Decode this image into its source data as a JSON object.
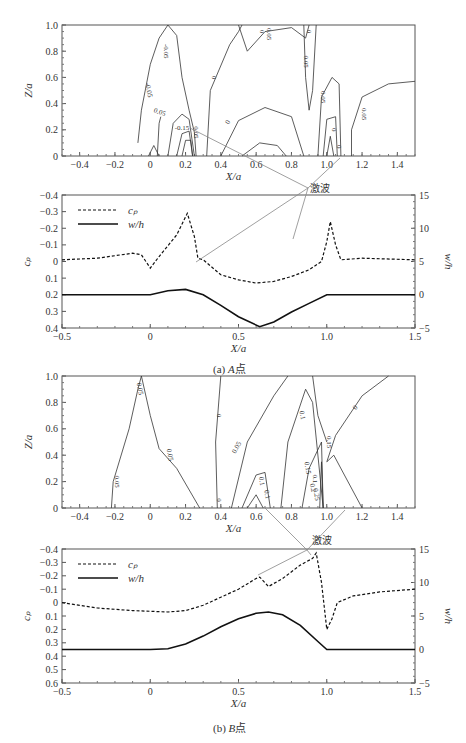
{
  "annotation": {
    "shock_label": "激波"
  },
  "captions": {
    "a": {
      "prefix": "(a)",
      "point": "A",
      "suffix": "点"
    },
    "b": {
      "prefix": "(b)",
      "point": "B",
      "suffix": "点"
    }
  },
  "chart_data": [
    {
      "id": "a-contour",
      "type": "contour",
      "title": "",
      "xlabel": "X/a",
      "ylabel": "Z/a",
      "xlim": [
        -0.5,
        1.5
      ],
      "ylim": [
        0,
        1.0
      ],
      "xticks": [
        "-0.4",
        "-0.2",
        "0",
        "0.2",
        "0.4",
        "0.6",
        "0.8",
        "1.0",
        "1.2",
        "1.4"
      ],
      "yticks": [
        "0",
        "0.2",
        "0.4",
        "0.6",
        "0.8",
        "1.0"
      ],
      "contour_labels": [
        "-0.05",
        "-0.05",
        "0.05",
        "-0.15",
        "0.05",
        "0",
        "0",
        "0.05",
        "0.05",
        "0",
        "0",
        "0.05",
        "0",
        "0",
        "0.05"
      ]
    },
    {
      "id": "a-line",
      "type": "line",
      "xlabel": "X/a",
      "ylabel_left": "c_p",
      "ylabel_right": "w/h",
      "xlim": [
        -0.5,
        1.5
      ],
      "ylim_left": [
        0.4,
        -0.4
      ],
      "ylim_right": [
        -5,
        15
      ],
      "xticks": [
        "-0.5",
        "0",
        "0.5",
        "1.0",
        "1.5"
      ],
      "yticks_left": [
        "-0.4",
        "-0.3",
        "-0.2",
        "-0.1",
        "0",
        "0.1",
        "0.2",
        "0.3",
        "0.4"
      ],
      "yticks_right": [
        "-5",
        "0",
        "5",
        "10",
        "15"
      ],
      "legend": [
        {
          "name": "c_p",
          "style": "dashed"
        },
        {
          "name": "w/h",
          "style": "solid"
        }
      ],
      "legend_position": "upper-left",
      "series": [
        {
          "name": "c_p",
          "axis": "left",
          "x": [
            -0.5,
            -0.3,
            -0.1,
            -0.05,
            0,
            0.05,
            0.15,
            0.21,
            0.25,
            0.27,
            0.3,
            0.4,
            0.5,
            0.6,
            0.7,
            0.8,
            0.9,
            0.97,
            1.0,
            1.02,
            1.05,
            1.08,
            1.2,
            1.5
          ],
          "y": [
            -0.01,
            -0.02,
            -0.05,
            -0.04,
            0.04,
            -0.03,
            -0.16,
            -0.29,
            -0.15,
            -0.02,
            -0.01,
            0.08,
            0.11,
            0.13,
            0.12,
            0.09,
            0.05,
            0.0,
            -0.12,
            -0.24,
            -0.1,
            -0.01,
            -0.02,
            -0.01
          ]
        },
        {
          "name": "w/h",
          "axis": "right",
          "x": [
            -0.5,
            0,
            0.1,
            0.2,
            0.3,
            0.4,
            0.5,
            0.62,
            0.7,
            0.8,
            0.9,
            1.0,
            1.5
          ],
          "y": [
            0,
            0,
            0.6,
            0.8,
            0,
            -1.6,
            -3.3,
            -4.8,
            -4.1,
            -2.6,
            -1.3,
            0,
            0
          ]
        }
      ]
    },
    {
      "id": "b-contour",
      "type": "contour",
      "xlabel": "X/a",
      "ylabel": "Z/a",
      "xlim": [
        -0.5,
        1.5
      ],
      "ylim": [
        0,
        1.0
      ],
      "xticks": [
        "-0.4",
        "-0.2",
        "0",
        "0.2",
        "0.4",
        "0.6",
        "0.8",
        "1.0",
        "1.2",
        "1.4"
      ],
      "yticks": [
        "0",
        "0.2",
        "0.4",
        "0.6",
        "0.8",
        "1.0"
      ],
      "contour_labels": [
        "0.05",
        "0.05",
        "0.05",
        "0",
        "0",
        "0.05",
        "0.1",
        "0.1",
        "0.1",
        "0.15",
        "0.2",
        "0.25",
        "0.15",
        "0.1",
        "0"
      ]
    },
    {
      "id": "b-line",
      "type": "line",
      "xlabel": "X/a",
      "ylabel_left": "c_p",
      "ylabel_right": "w/h",
      "xlim": [
        -0.5,
        1.5
      ],
      "ylim_left": [
        0.6,
        -0.4
      ],
      "ylim_right": [
        -5,
        15
      ],
      "xticks": [
        "-0.5",
        "0",
        "0.5",
        "1.0",
        "1.5"
      ],
      "yticks_left": [
        "-0.4",
        "-0.3",
        "-0.2",
        "-0.1",
        "0",
        "0.1",
        "0.2",
        "0.3",
        "0.4",
        "0.5",
        "0.6"
      ],
      "yticks_right": [
        "-5",
        "0",
        "5",
        "10",
        "15"
      ],
      "legend": [
        {
          "name": "c_p",
          "style": "dashed"
        },
        {
          "name": "w/h",
          "style": "solid"
        }
      ],
      "legend_position": "upper-left",
      "series": [
        {
          "name": "c_p",
          "axis": "left",
          "x": [
            -0.5,
            -0.3,
            -0.1,
            0.1,
            0.2,
            0.3,
            0.4,
            0.5,
            0.6,
            0.62,
            0.67,
            0.75,
            0.85,
            0.92,
            0.94,
            0.97,
            1.0,
            1.03,
            1.06,
            1.15,
            1.3,
            1.5
          ],
          "y": [
            0.0,
            0.04,
            0.06,
            0.07,
            0.06,
            0.02,
            -0.04,
            -0.1,
            -0.18,
            -0.19,
            -0.12,
            -0.18,
            -0.28,
            -0.33,
            -0.37,
            -0.15,
            0.2,
            0.12,
            0.0,
            -0.05,
            -0.08,
            -0.1
          ]
        },
        {
          "name": "w/h",
          "axis": "right",
          "x": [
            -0.5,
            0,
            0.1,
            0.2,
            0.3,
            0.4,
            0.5,
            0.6,
            0.67,
            0.75,
            0.85,
            0.95,
            1.0,
            1.5
          ],
          "y": [
            0,
            0,
            0.1,
            0.8,
            2.0,
            3.4,
            4.6,
            5.4,
            5.6,
            5.2,
            3.6,
            1.2,
            0,
            0
          ]
        }
      ]
    }
  ]
}
